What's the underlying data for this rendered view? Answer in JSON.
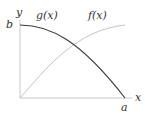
{
  "diagram": {
    "axes": {
      "x_label": "x",
      "y_label": "y",
      "x_tick_label": "a",
      "y_tick_label": "b"
    },
    "curves": [
      {
        "name": "g(x)",
        "label": "g(x)",
        "color": "#333333",
        "shape": "concave decreasing from (0,b) to (a,0)"
      },
      {
        "name": "f(x)",
        "label": "f(x)",
        "color": "#bbbbbb",
        "shape": "concave increasing from (0,0) to (a,b)"
      }
    ],
    "axis_color": "#bbbbbb"
  }
}
